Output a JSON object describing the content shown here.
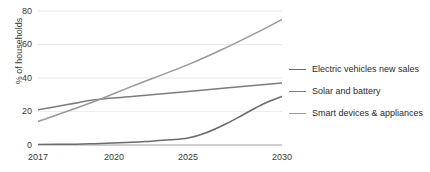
{
  "chart_data": {
    "type": "line",
    "title": "",
    "xlabel": "",
    "ylabel": "% of households",
    "x": [
      2017,
      2020,
      2025,
      2030
    ],
    "xlim": [
      2017,
      2030
    ],
    "ylim": [
      0,
      80
    ],
    "yticks": [
      0,
      20,
      40,
      60,
      80
    ],
    "xticks": [
      "2017",
      "2020",
      "2025",
      "2030"
    ],
    "grid": "horizontal",
    "legend_position": "right",
    "series": [
      {
        "name": "Electric vehicles new sales",
        "color": "#6b6b6b",
        "values": [
          0.3,
          0.8,
          4,
          29
        ],
        "points": [
          {
            "x": 2017,
            "y": 0.3
          },
          {
            "x": 2019,
            "y": 0.5
          },
          {
            "x": 2020,
            "y": 0.8
          },
          {
            "x": 2022,
            "y": 1.6
          },
          {
            "x": 2023,
            "y": 2.3
          },
          {
            "x": 2024,
            "y": 3.1
          },
          {
            "x": 2025,
            "y": 4.2
          },
          {
            "x": 2026,
            "y": 7.5
          },
          {
            "x": 2027,
            "y": 12.5
          },
          {
            "x": 2028,
            "y": 18.5
          },
          {
            "x": 2029,
            "y": 24.5
          },
          {
            "x": 2030,
            "y": 29
          }
        ]
      },
      {
        "name": "Solar and battery",
        "color": "#7c7c7c",
        "values": [
          21,
          27,
          32,
          37
        ],
        "points": [
          {
            "x": 2017,
            "y": 21
          },
          {
            "x": 2018,
            "y": 23
          },
          {
            "x": 2019,
            "y": 25
          },
          {
            "x": 2020,
            "y": 27
          },
          {
            "x": 2022,
            "y": 29
          },
          {
            "x": 2025,
            "y": 32
          },
          {
            "x": 2027,
            "y": 34
          },
          {
            "x": 2030,
            "y": 37
          }
        ]
      },
      {
        "name": "Smart devices & appliances",
        "color": "#9a9a9a",
        "values": [
          14,
          26,
          48,
          75
        ],
        "points": [
          {
            "x": 2017,
            "y": 14
          },
          {
            "x": 2020,
            "y": 26
          },
          {
            "x": 2022,
            "y": 35
          },
          {
            "x": 2025,
            "y": 48
          },
          {
            "x": 2027,
            "y": 58
          },
          {
            "x": 2029,
            "y": 69
          },
          {
            "x": 2030,
            "y": 75
          }
        ]
      }
    ]
  },
  "axes": {
    "y_title": "% of households",
    "y_tick_labels": [
      "80",
      "60",
      "40",
      "20",
      "0"
    ],
    "x_tick_labels": [
      "2017",
      "2020",
      "2025",
      "2030"
    ]
  },
  "legend": {
    "items": [
      {
        "label": "Electric vehicles new sales"
      },
      {
        "label": "Solar and battery"
      },
      {
        "label": "Smart devices & appliances"
      }
    ]
  },
  "style": {
    "background": "#ffffff",
    "grid_color": "#e6e6e6",
    "axis_color": "#5a5a5a",
    "text_color": "#3a3a3a"
  }
}
